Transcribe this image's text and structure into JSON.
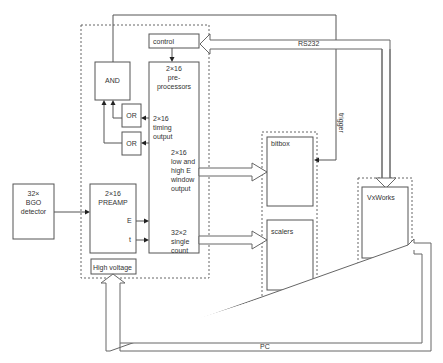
{
  "diagram": {
    "containers": {
      "frontend": "front-end electronics",
      "camac": "readout crate",
      "vme": "VME crate"
    },
    "blocks": {
      "control": "control",
      "preprocessors": [
        "2×16",
        "pre-",
        "processors"
      ],
      "and_gate": "AND",
      "or_gate_1": "OR",
      "or_gate_2": "OR",
      "timing_output": [
        "2×16",
        "timing",
        "output"
      ],
      "window_output": [
        "2×16",
        "low and",
        "high E",
        "window",
        "output"
      ],
      "single_count": [
        "32×2",
        "single",
        "count"
      ],
      "detector": [
        "32×",
        "BGO",
        "detector"
      ],
      "preamp": [
        "2×16",
        "PREAMP"
      ],
      "preamp_e": "E",
      "preamp_t": "t",
      "high_voltage": "High voltage",
      "bitbox": "bitbox",
      "scalers": "scalers",
      "phybus": [
        "Phybus/",
        "highway",
        "converter"
      ],
      "vxworks": "VxWorks",
      "highway_pci": [
        "Highway/",
        "PCI",
        "converter"
      ]
    },
    "connections": {
      "rs232": "RS232",
      "trigger": "trigger",
      "pci": "PCI",
      "highway": "highway",
      "pc": "PC"
    },
    "colors": {
      "stroke": "#555555",
      "text": "#333333",
      "background": "#ffffff"
    }
  }
}
